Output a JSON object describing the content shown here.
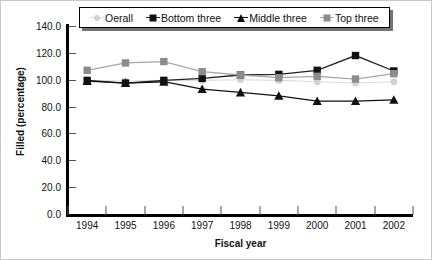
{
  "chart_data": {
    "type": "line",
    "title": "",
    "xlabel": "Fiscal year",
    "ylabel": "Filled (percentage)",
    "categories": [
      "1994",
      "1995",
      "1996",
      "1997",
      "1998",
      "1999",
      "2000",
      "2001",
      "2002"
    ],
    "x": [
      1994,
      1995,
      1996,
      1997,
      1998,
      1999,
      2000,
      2001,
      2002
    ],
    "ylim": [
      0.0,
      140.0
    ],
    "yticks": [
      "0.0",
      "20.0",
      "40.0",
      "60.0",
      "80.0",
      "100.0",
      "120.0",
      "140.0"
    ],
    "ytick_values": [
      0.0,
      20.0,
      40.0,
      60.0,
      80.0,
      100.0,
      120.0,
      140.0
    ],
    "grid": false,
    "legend_position": "top",
    "series": [
      {
        "name": "Oerall",
        "marker": "circle",
        "color": "#d2d2d2",
        "line_color": "#dcdcdc",
        "values": [
          99.5,
          99.0,
          99.5,
          99.5,
          100.0,
          99.5,
          98.5,
          97.5,
          98.5
        ]
      },
      {
        "name": "Bottom three",
        "marker": "square",
        "color": "#111111",
        "line_color": "#222222",
        "values": [
          99.5,
          97.5,
          99.5,
          101.0,
          103.5,
          104.0,
          107.0,
          118.0,
          106.5
        ]
      },
      {
        "name": "Middle three",
        "marker": "triangle",
        "color": "#111111",
        "line_color": "#111111",
        "values": [
          99.0,
          97.5,
          98.5,
          93.0,
          90.5,
          88.0,
          84.0,
          84.0,
          85.0
        ]
      },
      {
        "name": "Top three",
        "marker": "square",
        "color": "#8c8c8c",
        "line_color": "#a6a6a6",
        "values": [
          107.0,
          112.5,
          113.5,
          106.0,
          103.5,
          101.5,
          102.5,
          100.5,
          104.5
        ]
      }
    ]
  },
  "legend": {
    "items": [
      {
        "label": "Oerall"
      },
      {
        "label": "Bottom three"
      },
      {
        "label": "Middle three"
      },
      {
        "label": "Top three"
      }
    ]
  }
}
